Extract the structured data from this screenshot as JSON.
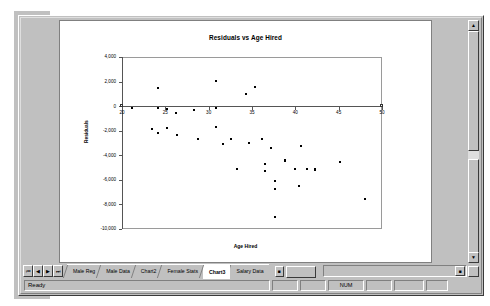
{
  "window": {
    "scrollbar": {
      "up_arrow": "▲",
      "down_arrow": "▼"
    }
  },
  "chart_data": {
    "type": "scatter",
    "title": "Residuals vs Age Hired",
    "xlabel": "Age Hired",
    "ylabel": "Residuals",
    "xlim": [
      20,
      50
    ],
    "ylim": [
      -10000,
      4000
    ],
    "xticks": [
      20,
      25,
      30,
      35,
      40,
      45,
      50
    ],
    "xtick_labels": [
      "20",
      "25",
      "30",
      "35",
      "40",
      "45",
      "50"
    ],
    "yticks": [
      4000,
      2000,
      0,
      -2000,
      -4000,
      -6000,
      -8000,
      -10000
    ],
    "ytick_labels": [
      "4,000",
      "2,000",
      "0",
      "-2,000",
      "-4,000",
      "-6,000",
      "-8,000",
      "-10,000"
    ],
    "grid": false,
    "legend": false,
    "marker": "square",
    "marker_color": "#000000",
    "points": [
      {
        "x": 20.0,
        "y": 0
      },
      {
        "x": 21.2,
        "y": -120
      },
      {
        "x": 24.1,
        "y": 1450
      },
      {
        "x": 24.1,
        "y": -130
      },
      {
        "x": 25.2,
        "y": -260
      },
      {
        "x": 26.2,
        "y": -560
      },
      {
        "x": 28.3,
        "y": -330
      },
      {
        "x": 30.9,
        "y": 2070
      },
      {
        "x": 30.9,
        "y": -180
      },
      {
        "x": 34.3,
        "y": 950
      },
      {
        "x": 35.3,
        "y": 1520
      },
      {
        "x": 23.5,
        "y": -1830
      },
      {
        "x": 25.2,
        "y": -1760
      },
      {
        "x": 24.2,
        "y": -2210
      },
      {
        "x": 26.3,
        "y": -2330
      },
      {
        "x": 30.8,
        "y": -1700
      },
      {
        "x": 28.8,
        "y": -2680
      },
      {
        "x": 31.6,
        "y": -3060
      },
      {
        "x": 32.6,
        "y": -2690
      },
      {
        "x": 34.7,
        "y": -3030
      },
      {
        "x": 36.2,
        "y": -2680
      },
      {
        "x": 37.2,
        "y": -3420
      },
      {
        "x": 40.6,
        "y": -3270
      },
      {
        "x": 38.8,
        "y": -4350
      },
      {
        "x": 38.8,
        "y": -4450
      },
      {
        "x": 36.5,
        "y": -4710
      },
      {
        "x": 45.1,
        "y": -4570
      },
      {
        "x": 33.3,
        "y": -5130
      },
      {
        "x": 36.5,
        "y": -5310
      },
      {
        "x": 40.0,
        "y": -5130
      },
      {
        "x": 41.4,
        "y": -5090
      },
      {
        "x": 42.3,
        "y": -5150
      },
      {
        "x": 42.3,
        "y": -5230
      },
      {
        "x": 37.6,
        "y": -6100
      },
      {
        "x": 37.6,
        "y": -6710
      },
      {
        "x": 40.4,
        "y": -6510
      },
      {
        "x": 48.0,
        "y": -7580
      },
      {
        "x": 37.6,
        "y": -9000
      },
      {
        "x": 50.0,
        "y": 0
      }
    ]
  },
  "tabbar": {
    "nav_first": "⏮",
    "nav_prev": "◀",
    "nav_next": "▶",
    "nav_last": "⏭",
    "tabs": [
      {
        "label": "Male Reg",
        "active": false
      },
      {
        "label": "Male Data",
        "active": false
      },
      {
        "label": "Chart2",
        "active": false
      },
      {
        "label": "Female Stats",
        "active": false
      },
      {
        "label": "Chart3",
        "active": true
      },
      {
        "label": "Salary Data",
        "active": false
      }
    ],
    "extra_btn": "■",
    "hscroll_btn": "■"
  },
  "statusbar": {
    "message": "Ready",
    "cells": [
      "",
      "",
      "NUM",
      "",
      "",
      ""
    ]
  }
}
